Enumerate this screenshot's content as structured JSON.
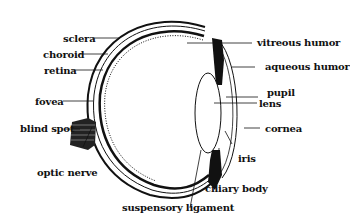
{
  "diagram": {
    "labels": {
      "sclera": "sclera",
      "choroid": "choroid",
      "retina": "retina",
      "fovea": "fovea",
      "blind_spot": "blind spot",
      "optic_nerve": "optic nerve",
      "vitreous_humor": "vitreous humor",
      "aqueous_humor": "aqueous humor",
      "pupil": "pupil",
      "lens": "lens",
      "cornea": "cornea",
      "iris": "iris",
      "ciliary_body": "ciliary body",
      "suspensory_ligament": "suspensory ligament"
    },
    "colors": {
      "ink": "#111111",
      "background": "#ffffff"
    }
  }
}
